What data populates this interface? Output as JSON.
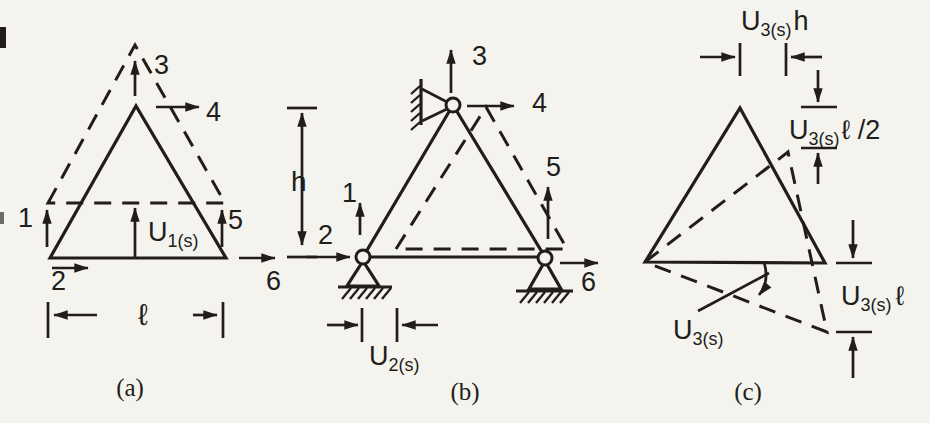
{
  "colors": {
    "ink": "#211e1a",
    "paper": "#f5f3ee"
  },
  "a": {
    "caption": "(a)",
    "d1": "1",
    "d2": "2",
    "d3": "3",
    "d4": "4",
    "d5": "5",
    "d6": "6",
    "mode_main": "U",
    "mode_sub": "1(s)",
    "dim_width": "ℓ"
  },
  "b": {
    "caption": "(b)",
    "d1": "1",
    "d2": "2",
    "d3": "3",
    "d4": "4",
    "d5": "5",
    "d6": "6",
    "mode_main": "U",
    "mode_sub": "2(s)",
    "dim_height": "h"
  },
  "c": {
    "caption": "(c)",
    "top_main": "U",
    "top_sub": "3(s)",
    "top_tail": "h",
    "apex_main": "U",
    "apex_sub": "3(s)",
    "apex_tail": "ℓ /2",
    "corner_main": "U",
    "corner_sub": "3(s)",
    "corner_tail": "ℓ",
    "rot_main": "U",
    "rot_sub": "3(s)"
  }
}
